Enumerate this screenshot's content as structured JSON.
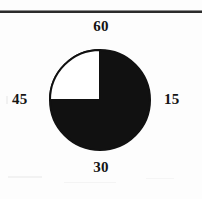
{
  "figure": {
    "type": "scanned-figure",
    "background_color": "#fdfdfd",
    "rule_color": "#2b2b2b"
  },
  "chart_data": {
    "type": "pie",
    "title": "",
    "subtitle": "",
    "xlabel": "",
    "ylabel": "",
    "grid": false,
    "legend": "none",
    "center": {
      "x": 100,
      "y": 100
    },
    "radius": 52,
    "stroke_color": "#111111",
    "categories": [
      "filled",
      "empty"
    ],
    "values": [
      75,
      25
    ],
    "slices": [
      {
        "name": "filled",
        "value": 75,
        "percent": 75,
        "start_angle_deg": 0,
        "end_angle_deg": 270,
        "color": "#111111"
      },
      {
        "name": "empty",
        "value": 25,
        "percent": 25,
        "start_angle_deg": 270,
        "end_angle_deg": 360,
        "color": "#ffffff"
      }
    ],
    "annotations": [
      {
        "position": "top",
        "text": "60"
      },
      {
        "position": "right",
        "text": "15"
      },
      {
        "position": "bottom",
        "text": "30"
      },
      {
        "position": "left",
        "text": "45"
      }
    ],
    "tick_labels": [
      "60",
      "15",
      "30",
      "45"
    ]
  },
  "labels": {
    "top": "60",
    "right": "15",
    "bottom": "30",
    "left": "45"
  }
}
